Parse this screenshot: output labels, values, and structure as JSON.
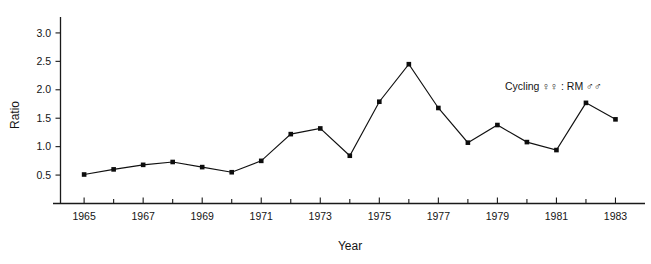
{
  "chart_data": {
    "type": "line",
    "title": "",
    "subtitle": "",
    "xlabel": "Year",
    "ylabel": "Ratio",
    "xlim": [
      1964.2,
      1984.0
    ],
    "ylim": [
      0.0,
      3.28
    ],
    "grid": false,
    "legend_position": "inside-top-right",
    "annotations": [
      {
        "name": "series-annotation",
        "text": "Cycling ♀♀ : RM ♂♂",
        "x": 1981.0,
        "y": 1.97
      }
    ],
    "xticks": [
      1965,
      1967,
      1969,
      1971,
      1973,
      1975,
      1977,
      1979,
      1981,
      1983
    ],
    "xtick_labels": [
      "1965",
      "1967",
      "1969",
      "1971",
      "1973",
      "1975",
      "1977",
      "1979",
      "1981",
      "1983"
    ],
    "xtick_minor": [
      1966,
      1968,
      1970,
      1972,
      1974,
      1976,
      1978,
      1980,
      1982
    ],
    "yticks": [
      0.5,
      1.0,
      1.5,
      2.0,
      2.5,
      3.0
    ],
    "ytick_labels": [
      "0.5",
      "1.0",
      "1.5",
      "2.0",
      "2.5",
      "3.0"
    ],
    "x": [
      1965,
      1966,
      1967,
      1968,
      1969,
      1970,
      1971,
      1972,
      1973,
      1974,
      1975,
      1976,
      1977,
      1978,
      1979,
      1980,
      1981,
      1982,
      1983
    ],
    "series": [
      {
        "name": "Cycling ♀♀ : RM ♂♂",
        "marker": "filled-square",
        "color": "#111111",
        "values": [
          0.51,
          0.6,
          0.68,
          0.73,
          0.64,
          0.55,
          0.75,
          1.22,
          1.32,
          0.84,
          1.79,
          2.45,
          1.68,
          1.07,
          1.38,
          1.08,
          0.94,
          1.77,
          1.48
        ]
      }
    ]
  },
  "axes": {
    "ylabel": "Ratio",
    "xlabel": "Year"
  },
  "legend": {
    "label": "Cycling ♀♀ : RM ♂♂"
  },
  "colors": {
    "axis": "#1a1a1a",
    "series": "#111111",
    "background": "#ffffff",
    "text": "#141414"
  }
}
